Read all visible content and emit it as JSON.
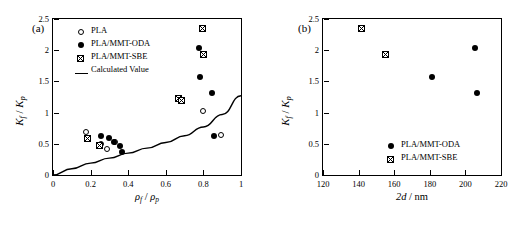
{
  "figure": {
    "panel_a_label": "(a)",
    "panel_b_label": "(b)"
  },
  "chart_data": [
    {
      "type": "scatter",
      "panel": "(a)",
      "title": "",
      "xlabel": "ρ_f / ρ_p",
      "ylabel": "K_f / K_p",
      "xlim": [
        0,
        1
      ],
      "ylim": [
        0,
        2.5
      ],
      "xticks": [
        0,
        0.2,
        0.4,
        0.6,
        0.8,
        1
      ],
      "xticklabels": [
        "0",
        "0.2",
        "0.4",
        "0.6",
        "0.8",
        "1"
      ],
      "yticks": [
        0,
        0.5,
        1,
        1.5,
        2,
        2.5
      ],
      "yticklabels": [
        "0",
        "0.5",
        "1",
        "1.5",
        "2",
        "2.5"
      ],
      "grid": false,
      "legend_position": "upper-left-inside",
      "series": [
        {
          "name": "PLA",
          "marker": "open-circle",
          "points": [
            [
              0.175,
              0.69
            ],
            [
              0.255,
              0.5
            ],
            [
              0.285,
              0.41
            ],
            [
              0.33,
              0.53
            ],
            [
              0.8,
              1.02
            ],
            [
              0.895,
              0.64
            ]
          ]
        },
        {
          "name": "PLA/MMT-ODA",
          "marker": "filled-circle",
          "points": [
            [
              0.255,
              0.62
            ],
            [
              0.3,
              0.6
            ],
            [
              0.325,
              0.53
            ],
            [
              0.355,
              0.47
            ],
            [
              0.365,
              0.37
            ],
            [
              0.775,
              2.04
            ],
            [
              0.78,
              1.57
            ],
            [
              0.845,
              1.31
            ],
            [
              0.855,
              0.63
            ]
          ]
        },
        {
          "name": "PLA/MMT-SBE",
          "marker": "crossed-square",
          "points": [
            [
              0.185,
              0.59
            ],
            [
              0.245,
              0.465
            ],
            [
              0.665,
              1.22
            ],
            [
              0.685,
              1.2
            ],
            [
              0.795,
              2.34
            ],
            [
              0.8,
              1.93
            ]
          ]
        },
        {
          "name": "Calculated Value",
          "marker": "line",
          "line": [
            [
              0.0,
              0.0
            ],
            [
              0.1,
              0.1
            ],
            [
              0.2,
              0.19
            ],
            [
              0.3,
              0.27
            ],
            [
              0.4,
              0.35
            ],
            [
              0.5,
              0.43
            ],
            [
              0.6,
              0.52
            ],
            [
              0.7,
              0.63
            ],
            [
              0.8,
              0.77
            ],
            [
              0.9,
              0.97
            ],
            [
              1.0,
              1.27
            ]
          ]
        }
      ]
    },
    {
      "type": "scatter",
      "panel": "(b)",
      "title": "",
      "xlabel": "2d / nm",
      "ylabel": "K_f / K_p",
      "xlim": [
        120,
        220
      ],
      "ylim": [
        0,
        2.5
      ],
      "xticks": [
        120,
        140,
        160,
        180,
        200,
        220
      ],
      "xticklabels": [
        "120",
        "140",
        "160",
        "180",
        "200",
        "220"
      ],
      "yticks": [
        0,
        0.5,
        1,
        1.5,
        2,
        2.5
      ],
      "yticklabels": [
        "0",
        "0.5",
        "1",
        "1.5",
        "2",
        "2.5"
      ],
      "grid": false,
      "legend_position": "lower-right-inside",
      "series": [
        {
          "name": "PLA/MMT-ODA",
          "marker": "filled-circle",
          "points": [
            [
              155.0,
              1.92
            ],
            [
              181.0,
              1.57
            ],
            [
              205.5,
              2.04
            ],
            [
              206.5,
              1.31
            ]
          ]
        },
        {
          "name": "PLA/MMT-SBE",
          "marker": "crossed-square",
          "points": [
            [
              141.5,
              2.34
            ],
            [
              155.0,
              1.93
            ]
          ]
        }
      ]
    }
  ],
  "panelA": {
    "legend": [
      {
        "label": "PLA",
        "marker": "open-circle"
      },
      {
        "label": "PLA/MMT-ODA",
        "marker": "filled-circle"
      },
      {
        "label": "PLA/MMT-SBE",
        "marker": "crossed-square"
      },
      {
        "label": "Calculated Value",
        "marker": "line"
      }
    ],
    "axis": {
      "y_num": "K",
      "y_num_sub": "f",
      "y_den": "K",
      "y_den_sub": "p",
      "x_num": "ρ",
      "x_num_sub": "f",
      "x_den": "ρ",
      "x_den_sub": "p",
      "xticklabels": [
        "0",
        "0.2",
        "0.4",
        "0.6",
        "0.8",
        "1"
      ],
      "yticklabels": [
        "0",
        "0.5",
        "1",
        "1.5",
        "2",
        "2.5"
      ]
    }
  },
  "panelB": {
    "legend": [
      {
        "label": "PLA/MMT-ODA",
        "marker": "filled-circle"
      },
      {
        "label": "PLA/MMT-SBE",
        "marker": "crossed-square"
      }
    ],
    "axis": {
      "y_num": "K",
      "y_num_sub": "f",
      "y_den": "K",
      "y_den_sub": "p",
      "x_label_pre": "2d",
      "x_label_post": "/ nm",
      "xticklabels": [
        "120",
        "140",
        "160",
        "180",
        "200",
        "220"
      ],
      "yticklabels": [
        "0",
        "0.5",
        "1",
        "1.5",
        "2",
        "2.5"
      ]
    }
  }
}
